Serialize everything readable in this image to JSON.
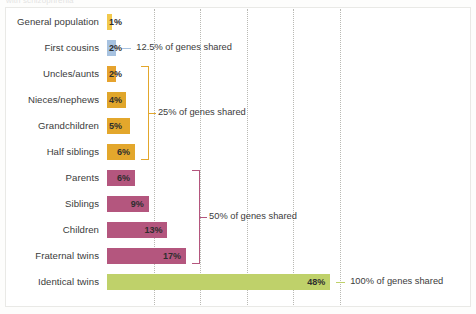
{
  "figure": {
    "clipped_caption": "with schizophrenia",
    "background": "#ffffff",
    "frame_color": "#e9e9e6",
    "gridline_color": "#b9b9b4"
  },
  "chart_data": {
    "type": "bar",
    "orientation": "horizontal",
    "title": "",
    "subtitle": "",
    "xlabel": "",
    "ylabel": "",
    "xlim": [
      0,
      55
    ],
    "grid": true,
    "gridlines_at": [
      10,
      20,
      30,
      40,
      50
    ],
    "legend_position": "none",
    "categories": [
      "General population",
      "First cousins",
      "Uncles/aunts",
      "Nieces/nephews",
      "Grandchildren",
      "Half siblings",
      "Parents",
      "Siblings",
      "Children",
      "Fraternal twins",
      "Identical twins"
    ],
    "values": [
      1,
      2,
      2,
      4,
      5,
      6,
      6,
      9,
      13,
      17,
      48
    ],
    "value_labels": [
      "1%",
      "2%",
      "2%",
      "4%",
      "5%",
      "6%",
      "6%",
      "9%",
      "13%",
      "17%",
      "48%"
    ],
    "bar_colors": [
      "#f2c94c",
      "#a7c2e0",
      "#e6a32e",
      "#e0a62b",
      "#e3a72c",
      "#e3a72c",
      "#b4567e",
      "#b4567e",
      "#b4567e",
      "#b4567e",
      "#bfd16a"
    ],
    "annotations": [
      {
        "id": "ann-12-5",
        "text": "12.5% of genes shared",
        "applies_to": [
          "First cousins"
        ],
        "connector": "dash",
        "color": "#a7c2e0"
      },
      {
        "id": "ann-25",
        "text": "25% of genes shared",
        "applies_to": [
          "Uncles/aunts",
          "Nieces/nephews",
          "Grandchildren",
          "Half siblings"
        ],
        "connector": "bracket",
        "color": "#e3a72c"
      },
      {
        "id": "ann-50",
        "text": "50% of genes shared",
        "applies_to": [
          "Parents",
          "Siblings",
          "Children",
          "Fraternal twins"
        ],
        "connector": "bracket",
        "color": "#b4567e"
      },
      {
        "id": "ann-100",
        "text": "100% of genes shared",
        "applies_to": [
          "Identical twins"
        ],
        "connector": "dash",
        "color": "#bfd16a"
      }
    ]
  }
}
